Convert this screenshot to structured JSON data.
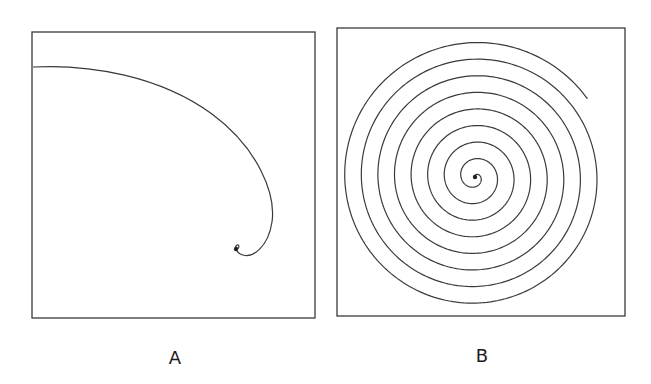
{
  "figure": {
    "background": "#ffffff",
    "stroke_color": "#3a3a3a",
    "panels": [
      {
        "id": "A",
        "label": "A",
        "label_pos": [
          175,
          347
        ],
        "box": {
          "x1": 32,
          "y1": 32,
          "x2": 315,
          "y2": 318
        },
        "curve_type": "logarithmic spiral (few turns visible)",
        "path": "M 33 67 C 90 64, 160 76, 212 114 C 258 148, 276 194, 272 222 C 268 248, 252 258, 243 255 C 236 253, 234 247, 237 245 C 239 244, 240 248, 237 249",
        "center_dot": [
          236,
          249
        ]
      },
      {
        "id": "B",
        "label": "B",
        "label_pos": [
          482,
          345
        ],
        "box": {
          "x1": 337,
          "y1": 28,
          "x2": 625,
          "y2": 316
        },
        "curve_type": "Archimedean spiral",
        "spiral": {
          "cx": 475,
          "cy": 177,
          "spacing_px": 16.6,
          "r_end": 137,
          "end_angle_rad": -0.59,
          "r_start": 1.5
        },
        "center_dot": [
          475,
          177
        ]
      }
    ]
  }
}
